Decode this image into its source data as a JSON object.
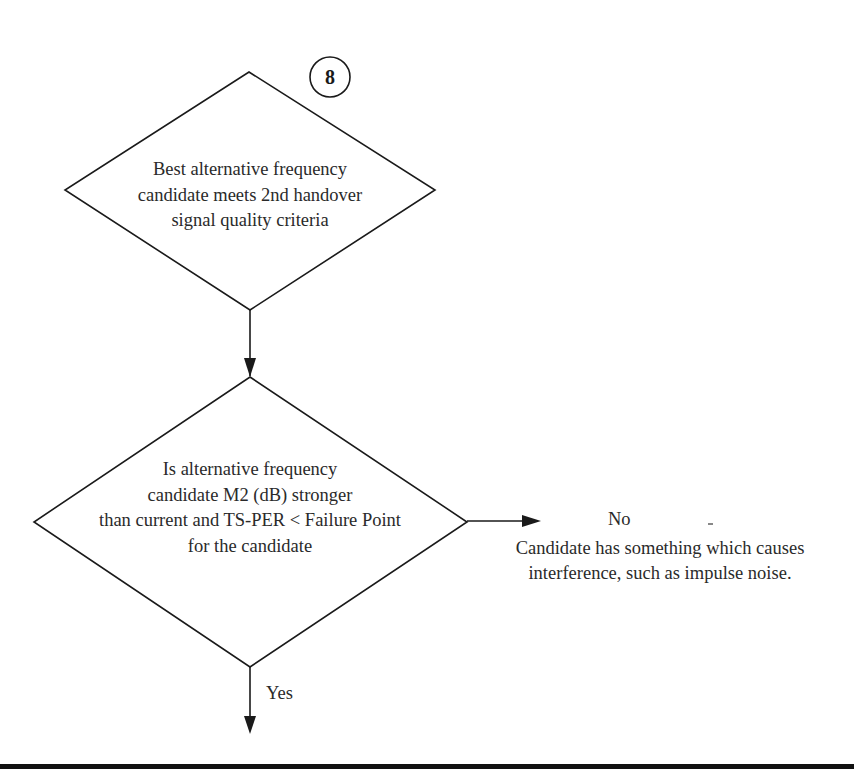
{
  "step": {
    "number": "8"
  },
  "decision1": {
    "lines": [
      "Best alternative frequency",
      "candidate meets 2nd handover",
      "signal quality criteria"
    ]
  },
  "decision2": {
    "lines": [
      "Is alternative frequency",
      "candidate M2 (dB) stronger",
      "than current and TS-PER < Failure Point",
      "for the candidate"
    ]
  },
  "branches": {
    "no_label": "No",
    "no_note_lines": [
      "Candidate has something which causes",
      "interference, such as impulse noise."
    ],
    "yes_label": "Yes"
  },
  "colors": {
    "stroke": "#1a1a1a",
    "text": "#2a2a2a",
    "background": "#ffffff"
  }
}
